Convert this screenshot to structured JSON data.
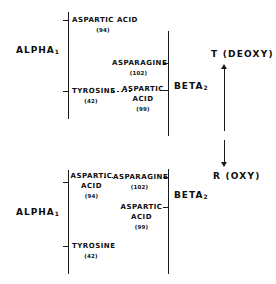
{
  "figure": {
    "type": "molecular-interaction-diagram"
  },
  "panels": [
    {
      "id": "t-state",
      "state_label": "T (DEOXY)",
      "arrow": "up",
      "alpha_chain": "ALPHA",
      "alpha_subscript": "1",
      "beta_chain": "BETA",
      "beta_subscript": "2",
      "alpha_residues": [
        {
          "name": "ASPARTIC ACID",
          "number": "(94)"
        },
        {
          "name": "TYROSINE",
          "number": "(42)"
        }
      ],
      "beta_residues": [
        {
          "name": "ASPARAGINE",
          "number": "(102)"
        },
        {
          "name": "ASPARTIC ACID",
          "number": "(99)"
        }
      ],
      "contacts": [
        {
          "from": "TYROSINE (42)",
          "to": "ASPARTIC ACID (99)"
        }
      ]
    },
    {
      "id": "r-state",
      "state_label": "R (OXY)",
      "arrow": "down",
      "alpha_chain": "ALPHA",
      "alpha_subscript": "1",
      "beta_chain": "BETA",
      "beta_subscript": "2",
      "alpha_residues": [
        {
          "name": "ASPARTIC ACID",
          "number": "(94)"
        },
        {
          "name": "TYROSINE",
          "number": "(42)"
        }
      ],
      "beta_residues": [
        {
          "name": "ASPARAGINE",
          "number": "(102)"
        },
        {
          "name": "ASPARTIC ACID",
          "number": "(99)"
        }
      ],
      "contacts": [
        {
          "from": "ASPARTIC ACID (94)",
          "to": "ASPARAGINE (102)"
        }
      ]
    }
  ],
  "top": {
    "asp94_name": "ASPARTIC ACID",
    "asp94_num": "(94)",
    "tyr42_name": "TYROSINE",
    "tyr42_num": "(42)",
    "asn102_name": "ASPARAGINE",
    "asn102_num": "(102)",
    "asp99_line1": "ASPARTIC",
    "asp99_line2": "ACID",
    "asp99_num": "(99)",
    "alpha": "ALPHA",
    "alpha_sub": "1",
    "beta": "BETA",
    "beta_sub": "2",
    "state": "T (DEOXY)"
  },
  "bottom": {
    "asp94_line1": "ASPARTIC",
    "asp94_line2": "ACID",
    "asp94_num": "(94)",
    "tyr42_name": "TYROSINE",
    "tyr42_num": "(42)",
    "asn102_name": "ASPARAGINE",
    "asn102_num": "(102)",
    "asp99_line1": "ASPARTIC",
    "asp99_line2": "ACID",
    "asp99_num": "(99)",
    "alpha": "ALPHA",
    "alpha_sub": "1",
    "beta": "BETA",
    "beta_sub": "2",
    "state": "R (OXY)"
  },
  "colors": {
    "ink": "#1a1a1a",
    "background": "#ffffff"
  }
}
